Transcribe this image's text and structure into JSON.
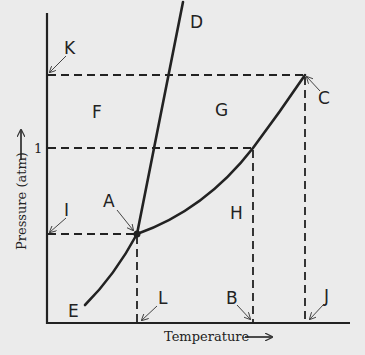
{
  "diagram": {
    "type": "phase-diagram",
    "axes": {
      "x_label": "Temperature",
      "y_label": "Pressure (atm)",
      "y_tick": "1"
    },
    "points": {
      "A": "A",
      "B": "B",
      "C": "C",
      "D": "D",
      "E": "E",
      "I": "I",
      "J": "J",
      "K": "K",
      "L": "L"
    },
    "regions": {
      "F": "F",
      "G": "G",
      "H": "H"
    },
    "colors": {
      "ink": "#222222",
      "background": "#ebebeb"
    }
  }
}
